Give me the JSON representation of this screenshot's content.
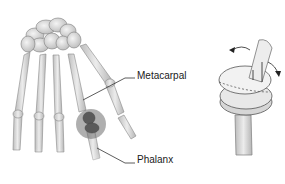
{
  "diagram": {
    "labels": {
      "metacarpal": "Metacarpal",
      "phalanx": "Phalanx"
    },
    "panels": [
      {
        "name": "hand-skeleton",
        "description": "Dorsal view of hand bones with highlighted MCP joint of the index finger"
      },
      {
        "name": "joint-implant",
        "description": "Two-piece finger joint implant with rotation arrows"
      }
    ],
    "colors": {
      "bone": "#d9d9d9",
      "bone_outline": "#8a8a8a",
      "highlight": "#7a7a7a",
      "leader_line": "#333333",
      "text": "#1a1a1a"
    }
  }
}
